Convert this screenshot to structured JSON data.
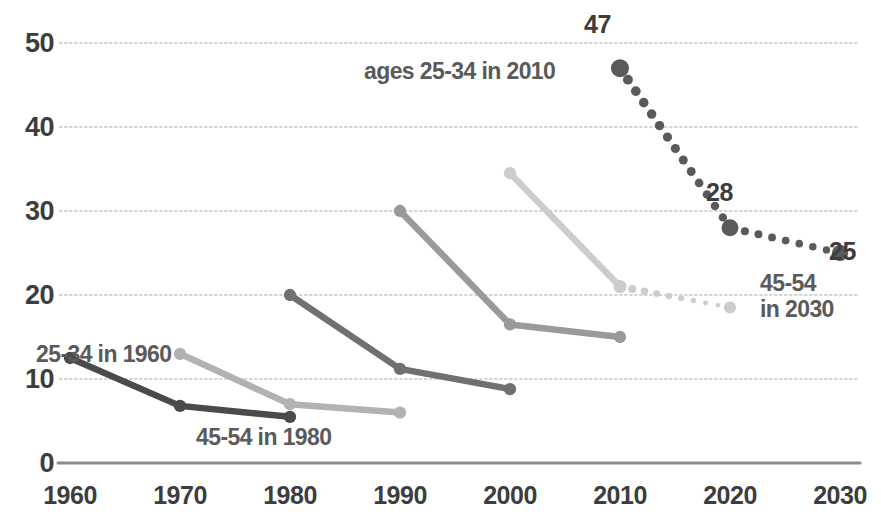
{
  "chart_data": {
    "type": "line",
    "title": "",
    "subtitle": "",
    "xlabel": "",
    "ylabel": "",
    "x": [
      1960,
      1970,
      1980,
      1990,
      2000,
      2010,
      2020,
      2030
    ],
    "xlim": [
      1960,
      2030
    ],
    "ylim": [
      0,
      50
    ],
    "yticks": [
      0,
      10,
      20,
      30,
      40,
      50
    ],
    "xticks": [
      "1960",
      "1970",
      "1980",
      "1990",
      "2000",
      "2010",
      "2020",
      "2030"
    ],
    "grid": "horizontal-dotted",
    "legend": "none (inline annotations)",
    "series": [
      {
        "name": "ages 25-34 in 1960",
        "color": "#4a4a4a",
        "style": "solid",
        "points": [
          {
            "x": 1960,
            "y": 12.5
          },
          {
            "x": 1970,
            "y": 6.8
          },
          {
            "x": 1980,
            "y": 5.5
          }
        ]
      },
      {
        "name": "ages 25-34 in 1970",
        "color": "#b2b2b2",
        "style": "solid",
        "points": [
          {
            "x": 1970,
            "y": 13.0
          },
          {
            "x": 1980,
            "y": 7.0
          },
          {
            "x": 1990,
            "y": 6.0
          }
        ]
      },
      {
        "name": "ages 25-34 in 1980",
        "color": "#707070",
        "style": "solid",
        "points": [
          {
            "x": 1980,
            "y": 20.0
          },
          {
            "x": 1990,
            "y": 11.2
          },
          {
            "x": 2000,
            "y": 8.8
          }
        ]
      },
      {
        "name": "ages 25-34 in 1990",
        "color": "#9a9a9a",
        "style": "solid",
        "points": [
          {
            "x": 1990,
            "y": 30.0
          },
          {
            "x": 2000,
            "y": 16.5
          },
          {
            "x": 2010,
            "y": 15.0
          }
        ]
      },
      {
        "name": "ages 25-34 in 2000",
        "color": "#cccccc",
        "style": "solid-then-dotted",
        "solid_points": [
          {
            "x": 2000,
            "y": 34.5
          },
          {
            "x": 2010,
            "y": 21.0
          }
        ],
        "dotted_points": [
          {
            "x": 2010,
            "y": 21.0
          },
          {
            "x": 2020,
            "y": 18.5
          }
        ]
      },
      {
        "name": "ages 25-34 in 2010",
        "color": "#5a5a5a",
        "style": "dotted",
        "points": [
          {
            "x": 2010,
            "y": 47.0
          },
          {
            "x": 2020,
            "y": 28.0
          },
          {
            "x": 2030,
            "y": 25.0
          }
        ]
      }
    ],
    "point_labels": [
      {
        "text": "47",
        "x": 2010,
        "y": 47,
        "anchor": "above"
      },
      {
        "text": "28",
        "x": 2020,
        "y": 28,
        "anchor": "above-right"
      },
      {
        "text": "25",
        "x": 2030,
        "y": 25,
        "anchor": "right"
      }
    ],
    "annotations": [
      {
        "text": "ages 25-34 in 2010",
        "x": 2010,
        "y": 46,
        "anchor": "left-of-point"
      },
      {
        "text": "25-34 in 1960",
        "x": 1960,
        "y": 16,
        "anchor": "above-right"
      },
      {
        "text": "45-54 in 1980",
        "x": 1980,
        "y": 2.5,
        "anchor": "below-right"
      },
      {
        "text": "45-54",
        "x": 2030,
        "y": 21,
        "anchor": "below"
      },
      {
        "text": "in 2030",
        "x": 2030,
        "y": 18,
        "anchor": "below"
      }
    ]
  },
  "axis": {
    "y_labels": [
      "50",
      "40",
      "30",
      "20",
      "10",
      "0"
    ],
    "x_labels": [
      "1960",
      "1970",
      "1980",
      "1990",
      "2000",
      "2010",
      "2020",
      "2030"
    ]
  },
  "labels": {
    "value_47": "47",
    "value_28": "28",
    "value_25": "25",
    "ann_2010": "ages 25-34 in 2010",
    "ann_1960": "25-34 in 1960",
    "ann_1980": "45-54 in 1980",
    "ann_2030_line1": "45-54",
    "ann_2030_line2": "in 2030"
  },
  "colors": {
    "text": "#3d3d3d",
    "annotation": "#5a5a5a",
    "gridline": "#d4d4d4",
    "axis": "#8c8c8c",
    "series_dark": "#4a4a4a",
    "series_light": "#b2b2b2",
    "series_mid_dark": "#707070",
    "series_mid": "#9a9a9a",
    "series_pale": "#cccccc",
    "series_dotted": "#5a5a5a"
  }
}
